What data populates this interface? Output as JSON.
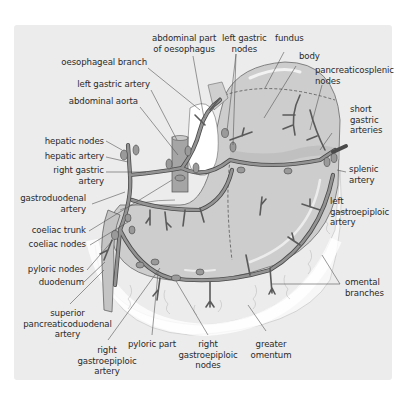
{
  "figure": {
    "colors": {
      "panel_bg": "#ececec",
      "stomach_fill": "#cfcfcf",
      "stomach_light": "#dcdcdc",
      "vessel": "#8f8f8f",
      "vessel_outline": "#4a4a4a",
      "node_fill": "#9a9a9a",
      "omentum_fill": "#f6f6f6",
      "label_text": "#2a2a2a",
      "leader_line": "#555555"
    },
    "labels": {
      "abdominal_part_of_oesophagus": "abdominal part\nof oesophagus",
      "left_gastric_nodes": "left gastric\nnodes",
      "fundus": "fundus",
      "body": "body",
      "oesophageal_branch": "oesophageal branch",
      "pancreaticosplenic_nodes": "pancreaticosplenic\nnodes",
      "left_gastric_artery": "left gastric artery",
      "abdominal_aorta": "abdominal aorta",
      "short_gastric_arteries": "short\ngastric\narteries",
      "hepatic_nodes": "hepatic nodes",
      "hepatic_artery": "hepatic artery",
      "right_gastric_artery": "right gastric\nartery",
      "splenic_artery": "splenic\nartery",
      "gastroduodenal_artery": "gastroduodenal\nartery",
      "left_gastroepiploic_artery": "left\ngastroepiploic\nartery",
      "coeliac_trunk": "coeliac trunk",
      "coeliac_nodes": "coeliac nodes",
      "pyloric_nodes": "pyloric nodes",
      "duodenum": "duodenum",
      "omental_branches": "omental\nbranches",
      "superior_pancreaticoduodenal_artery": "superior\npancreaticoduodenal\nartery",
      "pyloric_part": "pyloric part",
      "right_gastroepiploic_nodes": "right\ngastroepiploic\nnodes",
      "greater_omentum": "greater\nomentum",
      "right_gastroepiploic_artery": "right\ngastroepiploic\nartery"
    }
  }
}
